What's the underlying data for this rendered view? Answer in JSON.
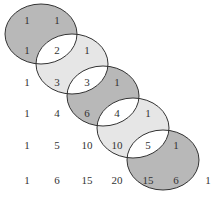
{
  "diagram": {
    "rows": [
      [
        "1",
        "1"
      ],
      [
        "1",
        "2",
        "1"
      ],
      [
        "1",
        "3",
        "3",
        "1"
      ],
      [
        "1",
        "4",
        "6",
        "4",
        "1"
      ],
      [
        "1",
        "5",
        "10",
        "10",
        "5",
        "1"
      ],
      [
        "1",
        "6",
        "15",
        "20",
        "15",
        "6",
        "1"
      ]
    ],
    "ellipses": [
      {
        "shade": "dark",
        "color": "#b8b8b8"
      },
      {
        "shade": "light",
        "color": "#e6e6e6"
      },
      {
        "shade": "dark",
        "color": "#b8b8b8"
      },
      {
        "shade": "light",
        "color": "#e6e6e6"
      },
      {
        "shade": "dark",
        "color": "#b8b8b8"
      }
    ],
    "overlap_color": "#ffffff"
  }
}
